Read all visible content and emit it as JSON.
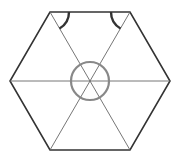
{
  "diagram": {
    "type": "geometry",
    "shape": "regular-hexagon",
    "vertices": [
      [
        50,
        12
      ],
      [
        130,
        12
      ],
      [
        170,
        81
      ],
      [
        130,
        150
      ],
      [
        50,
        150
      ],
      [
        10,
        81
      ]
    ],
    "center": [
      90,
      81
    ],
    "diagonals": 3,
    "center_circle_radius": 19,
    "angle_marks": [
      {
        "vertex": "top-left",
        "radius": 19
      },
      {
        "vertex": "top-right",
        "radius": 19
      }
    ],
    "colors": {
      "outline": "#333333",
      "diagonal": "#666666",
      "circle": "#888888",
      "angle_mark": "#333333"
    }
  }
}
